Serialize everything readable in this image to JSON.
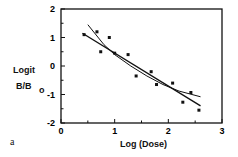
{
  "chart_data": {
    "type": "scatter",
    "title": "",
    "panel_label": "a",
    "xlabel": "Log (Dose)",
    "ylabel_line1": "Logit",
    "ylabel_line2": "B/B",
    "ylabel_sub": "o",
    "xlim": [
      0,
      3
    ],
    "ylim": [
      -2,
      2
    ],
    "xticks": [
      "0",
      "1",
      "2",
      "3"
    ],
    "yticks": [
      "2",
      "1",
      "0",
      "-1",
      "-2"
    ],
    "grid": false,
    "legend": null,
    "series": [
      {
        "name": "data points",
        "type": "scatter",
        "x": [
          0.43,
          0.67,
          0.74,
          0.9,
          1.0,
          1.25,
          1.4,
          1.68,
          1.78,
          2.08,
          2.27,
          2.42,
          2.57
        ],
        "y": [
          1.1,
          1.2,
          0.5,
          1.0,
          0.45,
          0.4,
          -0.35,
          -0.2,
          -0.65,
          -0.6,
          -1.27,
          -0.93,
          -1.55
        ]
      },
      {
        "name": "linear fit",
        "type": "line",
        "x": [
          0.4,
          2.6
        ],
        "y": [
          1.15,
          -1.4
        ]
      },
      {
        "name": "curved fit",
        "type": "line",
        "x": [
          0.5,
          0.8,
          1.0,
          1.3,
          1.6,
          1.9,
          2.2,
          2.6
        ],
        "y": [
          1.45,
          0.75,
          0.4,
          0.0,
          -0.35,
          -0.65,
          -0.88,
          -1.08
        ]
      }
    ]
  }
}
